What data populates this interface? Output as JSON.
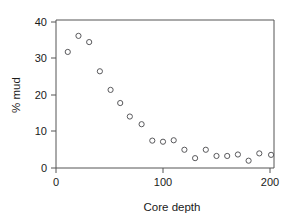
{
  "chart_data": {
    "type": "scatter",
    "title": "",
    "xlabel": "Core depth",
    "ylabel": "% mud",
    "xlim": [
      -5,
      210
    ],
    "ylim": [
      -2,
      41
    ],
    "xticks": [
      0,
      100,
      200
    ],
    "xticklabels": [
      "0",
      "100",
      "200"
    ],
    "yticks": [
      0,
      10,
      20,
      30,
      40
    ],
    "yticklabels": [
      "0",
      "10",
      "20",
      "30",
      "40"
    ],
    "grid": false,
    "legend": null,
    "marker": "open-circle",
    "marker_color": "#59595c",
    "x": [
      11,
      21,
      31,
      41,
      51,
      60,
      69,
      80,
      90,
      100,
      110,
      120,
      130,
      140,
      150,
      160,
      170,
      180,
      190,
      201
    ],
    "y": [
      31.8,
      36.2,
      34.5,
      26.5,
      21.4,
      17.8,
      14.1,
      12.0,
      7.5,
      7.2,
      7.6,
      5.0,
      2.7,
      5.0,
      3.3,
      3.3,
      3.7,
      2.0,
      4.0,
      3.6
    ],
    "points": [
      {
        "x": 11,
        "y": 31.8
      },
      {
        "x": 21,
        "y": 36.2
      },
      {
        "x": 31,
        "y": 34.5
      },
      {
        "x": 41,
        "y": 26.5
      },
      {
        "x": 51,
        "y": 21.4
      },
      {
        "x": 60,
        "y": 17.8
      },
      {
        "x": 69,
        "y": 14.1
      },
      {
        "x": 80,
        "y": 12.0
      },
      {
        "x": 90,
        "y": 7.5
      },
      {
        "x": 100,
        "y": 7.2
      },
      {
        "x": 110,
        "y": 7.6
      },
      {
        "x": 120,
        "y": 5.0
      },
      {
        "x": 130,
        "y": 2.7
      },
      {
        "x": 140,
        "y": 5.0
      },
      {
        "x": 150,
        "y": 3.3
      },
      {
        "x": 160,
        "y": 3.3
      },
      {
        "x": 170,
        "y": 3.7
      },
      {
        "x": 180,
        "y": 2.0
      },
      {
        "x": 190,
        "y": 4.0
      },
      {
        "x": 201,
        "y": 3.6
      }
    ]
  },
  "axes": {
    "x_title": "Core depth",
    "y_title": "% mud"
  }
}
